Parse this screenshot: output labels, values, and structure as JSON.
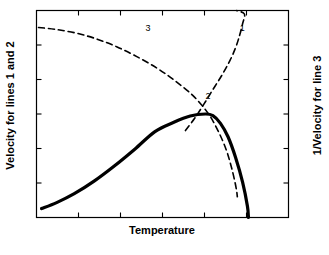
{
  "figure": {
    "background": "#ffffff",
    "axis_color": "#000000"
  },
  "labels": {
    "y_left": "Velocity for lines 1 and 2",
    "y_right": "1/Velocity for line 3",
    "x": "Temperature",
    "curve_1": "1",
    "curve_2": "2",
    "curve_3": "3"
  },
  "chart_data": {
    "type": "line",
    "title": "",
    "xlabel": "Temperature",
    "ylabel": "Velocity for lines 1 and 2",
    "ylabel_right": "1/Velocity for line 3",
    "grid": false,
    "legend": "inline-curve-labels",
    "axis_tick_labels": {
      "x": [],
      "y_left": [],
      "y_right": []
    },
    "x_tick_count": 5,
    "y_left_tick_count": 5,
    "y_right_tick_count": 5,
    "xlim": [
      0,
      1
    ],
    "ylim": [
      0,
      1
    ],
    "annotations": [
      {
        "text": "1",
        "x": 0.818,
        "y": 0.913,
        "series": "line-1"
      },
      {
        "text": "2",
        "x": 0.683,
        "y": 0.58,
        "series": "line-2"
      },
      {
        "text": "3",
        "x": 0.444,
        "y": 0.909,
        "series": "line-3"
      }
    ],
    "series": [
      {
        "name": "1",
        "style": "dashed",
        "width": 1.6,
        "color": "#000000",
        "description": "Arrhenius-type reaction rate rising steeply with temperature",
        "points": [
          [
            0.591,
            0.42
          ],
          [
            0.627,
            0.478
          ],
          [
            0.663,
            0.545
          ],
          [
            0.699,
            0.616
          ],
          [
            0.735,
            0.686
          ],
          [
            0.766,
            0.754
          ],
          [
            0.79,
            0.82
          ],
          [
            0.806,
            0.88
          ],
          [
            0.818,
            0.937
          ],
          [
            0.825,
            0.983
          ],
          [
            0.794,
            1.0
          ]
        ]
      },
      {
        "name": "2",
        "style": "solid",
        "width": 3.2,
        "color": "#000000",
        "description": "Overall crystal growth velocity; rises, peaks, then falls sharply",
        "points": [
          [
            0.02,
            0.043
          ],
          [
            0.08,
            0.072
          ],
          [
            0.15,
            0.115
          ],
          [
            0.23,
            0.177
          ],
          [
            0.31,
            0.25
          ],
          [
            0.39,
            0.33
          ],
          [
            0.47,
            0.415
          ],
          [
            0.545,
            0.46
          ],
          [
            0.61,
            0.49
          ],
          [
            0.67,
            0.5
          ],
          [
            0.7,
            0.492
          ],
          [
            0.73,
            0.455
          ],
          [
            0.76,
            0.39
          ],
          [
            0.79,
            0.29
          ],
          [
            0.818,
            0.17
          ],
          [
            0.837,
            0.055
          ],
          [
            0.841,
            0.0
          ]
        ]
      },
      {
        "name": "3",
        "style": "dashed",
        "width": 1.6,
        "color": "#000000",
        "description": "Inverse viscosity / diffusion term decreasing with temperature",
        "points": [
          [
            0.008,
            0.918
          ],
          [
            0.08,
            0.908
          ],
          [
            0.16,
            0.89
          ],
          [
            0.24,
            0.862
          ],
          [
            0.32,
            0.824
          ],
          [
            0.4,
            0.776
          ],
          [
            0.48,
            0.72
          ],
          [
            0.55,
            0.66
          ],
          [
            0.62,
            0.59
          ],
          [
            0.68,
            0.505
          ],
          [
            0.72,
            0.42
          ],
          [
            0.752,
            0.33
          ],
          [
            0.772,
            0.25
          ],
          [
            0.786,
            0.18
          ],
          [
            0.794,
            0.13
          ],
          [
            0.797,
            0.1
          ]
        ]
      }
    ]
  }
}
